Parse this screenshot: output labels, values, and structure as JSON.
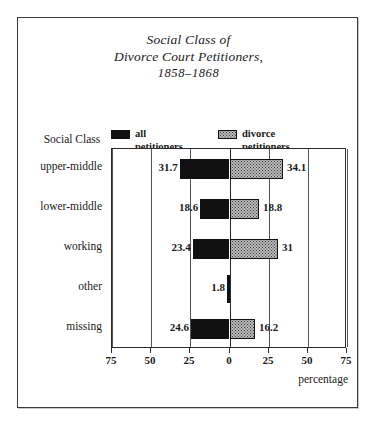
{
  "figure": {
    "title_lines": [
      "Social Class of",
      "Divorce Court Petitioners,",
      "1858–1868"
    ],
    "row_axis_title": "Social Class",
    "xaxis_title": "percentage",
    "colors": {
      "all_petitioners": "#111111",
      "divorce_petitioners": "#b9b9b9",
      "border": "#2b2b2b",
      "gridline": "#555555"
    }
  },
  "legend": {
    "entries": [
      {
        "name": "all-petitioners",
        "line1": "all",
        "line2": "petitioners",
        "swatch": "black-swatch-icon"
      },
      {
        "name": "divorce-petitioners",
        "line1": "divorce",
        "line2": "petitioners",
        "swatch": "stipple-swatch-icon"
      }
    ]
  },
  "chart_data": {
    "type": "bar",
    "orientation": "horizontal-bidirectional",
    "title": "Social Class of Divorce Court Petitioners, 1858–1868",
    "xlabel": "percentage",
    "ylabel": "Social Class",
    "xlim": [
      -75,
      75
    ],
    "xticks": [
      75,
      50,
      25,
      0,
      25,
      50,
      75
    ],
    "xtick_labels": [
      "75",
      "50",
      "25",
      "0",
      "25",
      "50",
      "75"
    ],
    "grid": true,
    "legend_position": "above-plot",
    "categories": [
      "upper-middle",
      "lower-middle",
      "working",
      "other",
      "missing"
    ],
    "series": [
      {
        "name": "all petitioners",
        "direction": "left",
        "values": [
          31.7,
          18.6,
          23.4,
          1.8,
          24.6
        ],
        "labels": [
          "31.7",
          "18.6",
          "23.4",
          "1.8",
          "24.6"
        ]
      },
      {
        "name": "divorce petitioners",
        "direction": "right",
        "values": [
          34.1,
          18.8,
          31,
          null,
          16.2
        ],
        "labels": [
          "34.1",
          "18.8",
          "31",
          "",
          "16.2"
        ]
      }
    ]
  }
}
